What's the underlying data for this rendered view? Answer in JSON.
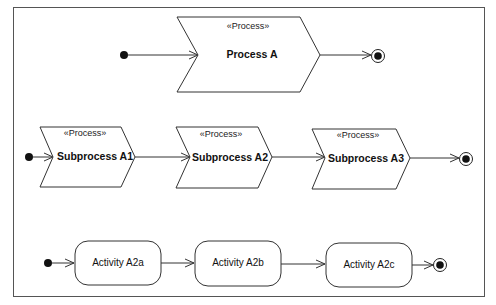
{
  "diagram": {
    "type": "UML activity diagram",
    "colors": {
      "line": "#333333",
      "background": "#ffffff",
      "text": "#111111"
    },
    "row1": {
      "process": {
        "stereotype": "«Process»",
        "name": "Process A"
      }
    },
    "row2": {
      "subprocesses": [
        {
          "stereotype": "«Process»",
          "name": "Subprocess A1"
        },
        {
          "stereotype": "«Process»",
          "name": "Subprocess A2"
        },
        {
          "stereotype": "«Process»",
          "name": "Subprocess A3"
        }
      ]
    },
    "row3": {
      "activities": [
        {
          "name": "Activity A2a"
        },
        {
          "name": "Activity A2b"
        },
        {
          "name": "Activity A2c"
        }
      ]
    },
    "icons": {
      "initial_node": "filled-circle",
      "final_node": "bullseye-circle",
      "flow_arrow": "open-arrowhead"
    }
  }
}
